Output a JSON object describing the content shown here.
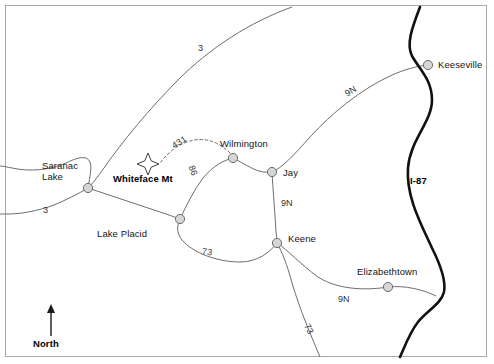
{
  "figure": {
    "kind": "reference-map",
    "region": "Adirondack Region, New York",
    "background_color": "#ffffff",
    "frame_color": "#a8a8a8"
  },
  "colors": {
    "minor_road": "#6d6d6d",
    "interstate": "#111111",
    "node_fill": "#d6d6d6",
    "node_stroke": "#6d6d6d",
    "text": "#1c1c1c"
  },
  "cities": [
    {
      "name": "Saranac\nLake",
      "line1": "Saranac",
      "line2": "Lake",
      "x": 88,
      "y": 188
    },
    {
      "name": "Lake Placid",
      "line1": "Lake Placid",
      "line2": "",
      "x": 180,
      "y": 219
    },
    {
      "name": "Wilmington",
      "line1": "Wilmington",
      "line2": "",
      "x": 233,
      "y": 158
    },
    {
      "name": "Jay",
      "line1": "Jay",
      "line2": "",
      "x": 272,
      "y": 172
    },
    {
      "name": "Keene",
      "line1": "Keene",
      "line2": "",
      "x": 277,
      "y": 243
    },
    {
      "name": "Keeseville",
      "line1": "Keeseville",
      "line2": "",
      "x": 428,
      "y": 65
    },
    {
      "name": "Elizabethtown",
      "line1": "Elizabethtown",
      "line2": "",
      "x": 388,
      "y": 287
    }
  ],
  "labels": {
    "saranac_lake_1": "Saranac",
    "saranac_lake_2": "Lake",
    "lake_placid": "Lake Placid",
    "wilmington": "Wilmington",
    "jay": "Jay",
    "keene": "Keene",
    "keeseville": "Keeseville",
    "elizabethtown": "Elizabethtown",
    "whiteface_mt": "Whiteface Mt",
    "interstate_87": "I-87",
    "compass_north": "North"
  },
  "route_labels": [
    {
      "id": "route-3-north",
      "text": "3",
      "x": 200,
      "y": 47
    },
    {
      "id": "route-3-west",
      "text": "3",
      "x": 44,
      "y": 208
    },
    {
      "id": "route-431",
      "text": "431",
      "x": 172,
      "y": 146
    },
    {
      "id": "route-86",
      "text": "86",
      "x": 197,
      "y": 170
    },
    {
      "id": "route-9n-northeast",
      "text": "9N",
      "x": 345,
      "y": 93
    },
    {
      "id": "route-9n-jay-keene",
      "text": "9N",
      "x": 282,
      "y": 203
    },
    {
      "id": "route-9n-elizabethtown",
      "text": "9N",
      "x": 340,
      "y": 299
    },
    {
      "id": "route-73-placid-keene",
      "text": "73",
      "x": 206,
      "y": 250
    },
    {
      "id": "route-73-south",
      "text": "73",
      "x": 313,
      "y": 327
    }
  ],
  "peak": {
    "label": "Whiteface Mt",
    "symbol": "four-point-star",
    "x": 148,
    "y": 164,
    "label_x": 113,
    "label_y": 175
  },
  "compass": {
    "label": "North",
    "arrow_x": 51,
    "arrow_top_y": 307,
    "arrow_bottom_y": 335,
    "label_x": 33,
    "label_y": 338
  },
  "roads": [
    {
      "id": "route-3-corridor",
      "name": "NY Route 3",
      "style": "solid",
      "label": "3"
    },
    {
      "id": "route-3-south-loop",
      "name": "NY Route 3 (south)",
      "style": "solid",
      "label": "3"
    },
    {
      "id": "route-86-saranac-placid",
      "name": "NY Route 86 Saranac Lake to Lake Placid",
      "style": "solid",
      "label": "86"
    },
    {
      "id": "route-86-placid-wilmington",
      "name": "NY Route 86 Lake Placid to Wilmington",
      "style": "solid",
      "label": "86"
    },
    {
      "id": "route-431-whiteface",
      "name": "NY Route 431 Whiteface Memorial Highway",
      "style": "dashed",
      "label": "431"
    },
    {
      "id": "route-86-wilmington-jay",
      "name": "NY Route 86 Wilmington to Jay",
      "style": "solid",
      "label": ""
    },
    {
      "id": "route-9n-jay-keeseville",
      "name": "NY Route 9N Jay to Keeseville",
      "style": "solid",
      "label": "9N"
    },
    {
      "id": "route-9n-jay-keene",
      "name": "NY Route 9N Jay to Keene",
      "style": "solid",
      "label": "9N"
    },
    {
      "id": "route-9n-keene-elizabethtown",
      "name": "NY Route 9N Keene to Elizabethtown",
      "style": "solid",
      "label": "9N"
    },
    {
      "id": "route-73-placid-keene",
      "name": "NY Route 73 Lake Placid to Keene",
      "style": "solid",
      "label": "73"
    },
    {
      "id": "route-73-keene-south",
      "name": "NY Route 73 Keene south",
      "style": "solid",
      "label": "73"
    },
    {
      "id": "interstate-87",
      "name": "Interstate 87 (Adirondack Northway)",
      "style": "heavy",
      "label": "I-87"
    }
  ]
}
